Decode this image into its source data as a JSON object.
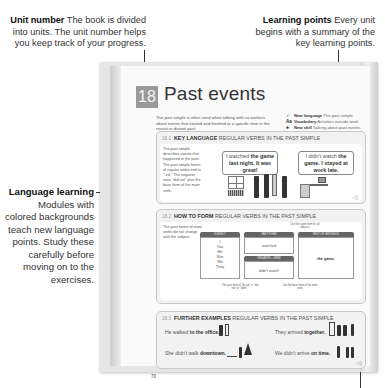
{
  "callouts": {
    "unit_number": {
      "title": "Unit number",
      "text": "The book is divided into units. The unit number helps you keep track of your progress."
    },
    "learning_points": {
      "title": "Learning points",
      "text": "Every unit begins with a summary of the key learning points."
    },
    "language_learning": {
      "title": "Language learning",
      "text": "Modules with colored backgrounds teach new language points. Study these carefully before moving on to the exercises."
    }
  },
  "page": {
    "unit_number": "18",
    "unit_title": "Past events",
    "intro": "The past simple is often used when talking with co-workers about events that started and finished at a specific time in the recent or distant past.",
    "summary": [
      {
        "icon": "new-language-icon",
        "glyph": "♂",
        "label": "New language",
        "value": "The past simple"
      },
      {
        "icon": "vocabulary-icon",
        "glyph": "Aa",
        "label": "Vocabulary",
        "value": "Activities outside work"
      },
      {
        "icon": "new-skill-icon",
        "glyph": "♣",
        "label": "New skill",
        "value": "Talking about past events"
      }
    ],
    "page_number": "70"
  },
  "modules": [
    {
      "num": "18.1",
      "heading_bold": "KEY LANGUAGE",
      "heading_rest": "REGULAR VERBS IN THE PAST SIMPLE",
      "description": "The past simple describes events that happened in the past. The past simple forms of regular verbs end in \"-ed.\" The negative uses \"did not\" plus the base form of the main verb.",
      "bubble1_plain": "I watched ",
      "bubble1_bold": "the game last night. It was great!",
      "bubble2_plain": "I didn't watch ",
      "bubble2_bold": "the game. I stayed at work late."
    },
    {
      "num": "18.2",
      "heading_bold": "HOW TO FORM",
      "heading_rest": "REGULAR VERBS IN THE PAST SIMPLE",
      "description": "The past forms of most verbs do not change with the subject.",
      "columns": {
        "subject": "SUBJECT",
        "past_form": "PAST FORM",
        "negative": "NEGATIVE + VERB",
        "rest": "REST OF SENTENCE"
      },
      "subjects": [
        "I",
        "You",
        "He",
        "She",
        "We",
        "They"
      ],
      "past_value": "watched",
      "negative_value": "didn't watch",
      "rest_value": "the game.",
      "note_top": "Use the same form for all subjects.",
      "note_left": "The past form of \"do not\" is \"did not\" or \"didn't.\"",
      "note_right": "Use the base form of the main verb."
    },
    {
      "num": "18.3",
      "heading_bold": "FURTHER EXAMPLES",
      "heading_rest": "REGULAR VERBS IN THE PAST SIMPLE",
      "examples": [
        {
          "plain": "He walked ",
          "bold": "to the office."
        },
        {
          "plain": "They arrived ",
          "bold": "together."
        },
        {
          "plain": "She didn't walk ",
          "bold": "downtown."
        },
        {
          "plain": "We didn't arrive ",
          "bold": "on time."
        }
      ]
    }
  ],
  "icons": {
    "audio": "◁)"
  }
}
